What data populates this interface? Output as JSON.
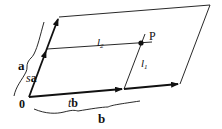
{
  "diagram": {
    "labels": {
      "origin": "0",
      "vector_a": "a",
      "scaled_a_s": "s",
      "scaled_a_a": "a",
      "vector_b": "b",
      "scaled_b_t": "t",
      "scaled_b_b": "b",
      "line_l1_l": "l",
      "line_l1_sub": "1",
      "line_l2_l": "l",
      "line_l2_sub": "2",
      "point": "P"
    },
    "colors": {
      "stroke": "#111111",
      "background": "#ffffff"
    }
  }
}
